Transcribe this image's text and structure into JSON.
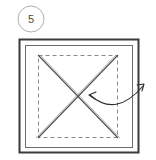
{
  "figure": {
    "step": {
      "label": "5",
      "shape": "circle",
      "center_x": 31,
      "center_y": 19,
      "radius": 13,
      "stroke_color": "#b0b0b0"
    },
    "background_color": "#ffffff",
    "outer_square": {
      "name": "paper-outer-edge",
      "x": 19,
      "y": 39,
      "width": 120,
      "height": 114,
      "stroke_color": "#3a3a3a",
      "stroke_width": 2
    },
    "inner_square": {
      "name": "paper-inner-crease",
      "x": 25,
      "y": 45,
      "width": 108,
      "height": 103,
      "stroke_color": "#6e6e6e",
      "stroke_width": 1
    },
    "dashed_square": {
      "name": "valley-fold-guide",
      "x": 38,
      "y": 55,
      "width": 80,
      "height": 83,
      "stroke_color": "#8a8a8a",
      "stroke_width": 1,
      "dash_pattern": "4 3"
    },
    "diagonals": {
      "name": "x-crease-lines",
      "stroke_color": "#5a5a5a",
      "line_1": {
        "x1": 38,
        "y1": 55,
        "x2": 118,
        "y2": 138
      },
      "line_2": {
        "x1": 118,
        "y1": 55,
        "x2": 38,
        "y2": 138
      },
      "intersection_x": 78,
      "intersection_y": 96
    },
    "fold_arrow": {
      "name": "fold-direction-arrow",
      "stroke_color": "#2e2e2e",
      "start_x": 90,
      "start_y": 95,
      "end_x": 143,
      "end_y": 85,
      "control_x": 118,
      "control_y": 114,
      "double_headed": true,
      "head_left_angle_deg": 215,
      "head_right_angle_deg": 310
    }
  }
}
